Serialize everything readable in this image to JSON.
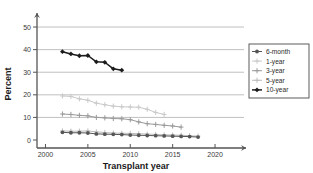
{
  "chart_data": {
    "type": "line",
    "title": "",
    "xlabel": "Transplant year",
    "ylabel": "Percent",
    "xlim": [
      1999,
      2022
    ],
    "ylim": [
      0,
      54
    ],
    "xticks": [
      2000,
      2005,
      2010,
      2015,
      2020
    ],
    "yticks": [
      0,
      10,
      20,
      30,
      40,
      50
    ],
    "grid": "horizontal",
    "legend_position": "right",
    "series": [
      {
        "name": "6-month",
        "color": "#555555",
        "marker": "circle",
        "x": [
          2002,
          2003,
          2004,
          2005,
          2006,
          2007,
          2008,
          2009,
          2010,
          2011,
          2012,
          2013,
          2014,
          2015,
          2016,
          2017,
          2018
        ],
        "values": [
          3.4,
          3.2,
          3.2,
          3.1,
          2.7,
          2.6,
          2.5,
          2.4,
          2.2,
          2.1,
          2.0,
          1.9,
          1.8,
          1.7,
          1.6,
          1.5,
          1.3
        ]
      },
      {
        "name": "1-year",
        "color": "#c9c9c9",
        "marker": "plus",
        "x": [
          2002,
          2003,
          2004,
          2005,
          2006,
          2007,
          2008,
          2009,
          2010,
          2011,
          2012,
          2013,
          2014
        ],
        "values": [
          19.5,
          19.3,
          18.2,
          17.6,
          16.3,
          15.6,
          15.0,
          14.7,
          14.6,
          14.5,
          13.6,
          12.2,
          11.3
        ]
      },
      {
        "name": "3-year",
        "color": "#9a9a9a",
        "marker": "plus",
        "x": [
          2002,
          2003,
          2004,
          2005,
          2006,
          2007,
          2008,
          2009,
          2010,
          2011,
          2012,
          2013,
          2014,
          2015,
          2016
        ],
        "values": [
          11.5,
          11.3,
          10.9,
          10.7,
          10.0,
          9.8,
          9.5,
          9.4,
          9.0,
          8.0,
          7.2,
          6.9,
          6.5,
          6.2,
          5.7
        ]
      },
      {
        "name": "5-year",
        "color": "#bdbdbd",
        "marker": "plus",
        "x": [
          2002,
          2003,
          2004,
          2005,
          2006,
          2007,
          2008,
          2009,
          2010,
          2011,
          2012,
          2013,
          2014,
          2015,
          2016,
          2017,
          2018
        ],
        "values": [
          4.0,
          3.9,
          3.9,
          4.0,
          3.6,
          3.3,
          3.1,
          3.0,
          2.9,
          2.8,
          2.6,
          2.5,
          2.3,
          2.2,
          2.1,
          1.9,
          1.7
        ]
      },
      {
        "name": "10-year",
        "color": "#1c1c1c",
        "marker": "diamond",
        "x": [
          2002,
          2003,
          2004,
          2005,
          2006,
          2007,
          2008,
          2009
        ],
        "values": [
          39.1,
          38.1,
          37.3,
          37.4,
          34.6,
          34.4,
          31.5,
          30.9
        ]
      }
    ]
  },
  "axes": {
    "y_title": "Percent",
    "x_title": "Transplant year",
    "y_tick_labels": [
      "0",
      "10",
      "20",
      "30",
      "40",
      "50"
    ],
    "x_tick_labels": [
      "2000",
      "2005",
      "2010",
      "2015",
      "2020"
    ]
  },
  "legend": {
    "items": [
      {
        "label": "6-month"
      },
      {
        "label": "1-year"
      },
      {
        "label": "3-year"
      },
      {
        "label": "5-year"
      },
      {
        "label": "10-year"
      }
    ]
  }
}
